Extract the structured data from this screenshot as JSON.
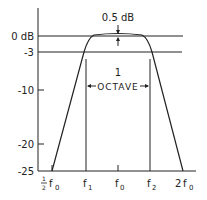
{
  "diagram": {
    "y_labels": [
      {
        "label": "0 dB",
        "y": 36
      },
      {
        "label": "-3",
        "y": 52
      },
      {
        "label": "-10",
        "y": 90
      },
      {
        "label": "-20",
        "y": 144
      },
      {
        "label": "-25",
        "y": 171
      }
    ],
    "x_labels": {
      "half_f0": {
        "num": "1",
        "den": "2",
        "sym": "f",
        "sub": "0"
      },
      "f1": {
        "sym": "f",
        "sub": "1"
      },
      "f0": {
        "sym": "f",
        "sub": "0"
      },
      "f2": {
        "sym": "f",
        "sub": "2"
      },
      "two_f0": {
        "pre": "2",
        "sym": "f",
        "sub": "0"
      }
    },
    "ripple_label": "0.5 dB",
    "octave_label_top": "1",
    "octave_label_bottom": "OCTAVE",
    "stroke_color": "#222222"
  }
}
